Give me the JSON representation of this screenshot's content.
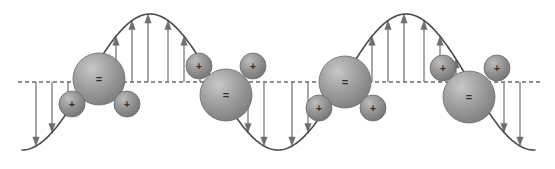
{
  "figure": {
    "background_color": "#ffffff",
    "width": 555,
    "height": 169
  },
  "colors": {
    "wave_stroke": "#4a4a4a",
    "baseline_stroke": "#6b6b6b",
    "arrow_stroke": "#6e6e6e",
    "oxygen_fill": "#9a9a9a",
    "oxygen_highlight": "#c3c3c3",
    "oxygen_shadow": "#7c7c7c",
    "hydrogen_fill": "#8f8f8f",
    "hydrogen_highlight": "#b8b8b8",
    "hydrogen_shadow": "#707070",
    "sphere_outline": "#6a6a6a",
    "charge_text": "#2f2f2f"
  },
  "wave": {
    "baseline_y": 82,
    "crest_y": 14,
    "trough_y": 153,
    "amplitude": 68,
    "start_x": 22,
    "end_x": 535,
    "wavelength": 256,
    "stroke_width": 1.6,
    "phase": "starts descending into a trough at the left edge"
  },
  "baseline": {
    "label": "equilibrium-axis",
    "dash_pattern": "4 3",
    "stroke_width": 1.4,
    "x_start": 18,
    "x_end": 540
  },
  "field_arrows": {
    "description": "Vertical field vectors drawn from the dashed equilibrium axis to the wave curve",
    "stroke_width": 1.2,
    "head_length": 9,
    "head_half_width": 3.2,
    "groups": [
      {
        "name": "trough-arrows-left",
        "direction": "down",
        "x_positions": [
          36,
          52,
          68,
          84,
          100,
          116,
          132,
          148
        ]
      },
      {
        "name": "crest-arrows-left",
        "direction": "up",
        "x_positions": [
          168,
          184,
          200,
          216,
          232,
          248,
          264
        ]
      },
      {
        "name": "trough-arrows-right",
        "direction": "down",
        "x_positions": [
          292,
          308,
          324,
          340,
          356,
          372,
          388,
          404
        ]
      },
      {
        "name": "crest-arrows-right",
        "direction": "up",
        "x_positions": [
          424,
          440,
          456,
          472,
          488,
          504,
          520
        ]
      }
    ]
  },
  "molecules": [
    {
      "id": "molecule-trough-left",
      "label": "water-molecule",
      "orientation": "upright",
      "position_note": "sits in the left trough, oxygen straddling the equilibrium axis",
      "oxygen": {
        "cx": 99,
        "cy": 79,
        "r": 26,
        "charge": "="
      },
      "hydrogens": [
        {
          "cx": 72,
          "cy": 104,
          "r": 13,
          "charge": "+"
        },
        {
          "cx": 127,
          "cy": 104,
          "r": 13,
          "charge": "+"
        }
      ]
    },
    {
      "id": "molecule-crest-left",
      "label": "water-molecule",
      "orientation": "inverted",
      "position_note": "sits at the left crest, hydrogens raised above the oxygen",
      "oxygen": {
        "cx": 226,
        "cy": 95,
        "r": 26,
        "charge": "="
      },
      "hydrogens": [
        {
          "cx": 199,
          "cy": 66,
          "r": 13,
          "charge": "+"
        },
        {
          "cx": 253,
          "cy": 66,
          "r": 13,
          "charge": "+"
        }
      ]
    },
    {
      "id": "molecule-trough-right",
      "label": "water-molecule",
      "orientation": "upright",
      "position_note": "sits in the right trough, oxygen straddling the equilibrium axis",
      "oxygen": {
        "cx": 345,
        "cy": 82,
        "r": 26,
        "charge": "="
      },
      "hydrogens": [
        {
          "cx": 319,
          "cy": 108,
          "r": 13,
          "charge": "+"
        },
        {
          "cx": 373,
          "cy": 108,
          "r": 13,
          "charge": "+"
        }
      ]
    },
    {
      "id": "molecule-crest-right",
      "label": "water-molecule",
      "orientation": "inverted",
      "position_note": "sits at the right crest, hydrogens raised above the oxygen",
      "oxygen": {
        "cx": 469,
        "cy": 97,
        "r": 26,
        "charge": "="
      },
      "hydrogens": [
        {
          "cx": 443,
          "cy": 68,
          "r": 13,
          "charge": "+"
        },
        {
          "cx": 497,
          "cy": 68,
          "r": 13,
          "charge": "+"
        }
      ]
    }
  ],
  "charge_symbols": {
    "negative": "=",
    "positive": "+",
    "negative_font_size": 11,
    "positive_font_size": 10
  }
}
